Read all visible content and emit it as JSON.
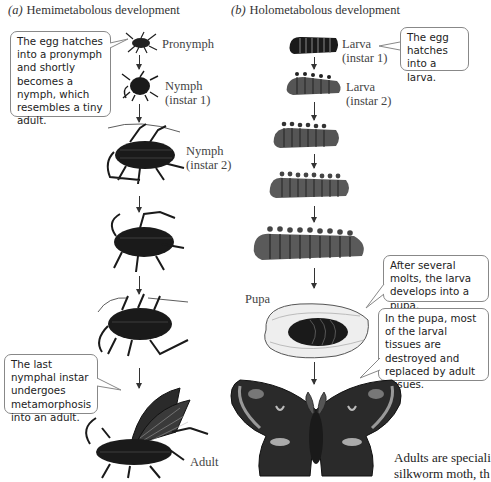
{
  "panels": {
    "a": {
      "letter": "(a)",
      "title": "Hemimetabolous development",
      "stages": [
        {
          "label": "Pronymph"
        },
        {
          "label": "Nymph\n(instar 1)"
        },
        {
          "label": "Nymph\n(instar 2)"
        },
        {
          "label": "Adult"
        }
      ],
      "callouts": [
        {
          "text": "The egg hatches into a pronymph and shortly becomes a nymph, which resembles a tiny adult."
        },
        {
          "text": "The last nymphal instar undergoes metamorphosis into an adult."
        }
      ]
    },
    "b": {
      "letter": "(b)",
      "title": "Holometabolous development",
      "stages": [
        {
          "label": "Larva\n(instar 1)"
        },
        {
          "label": "Larva\n(instar 2)"
        },
        {
          "label": "Pupa"
        }
      ],
      "callouts": [
        {
          "text": "The egg hatches into a larva."
        },
        {
          "text": "After several molts, the larva develops into a pupa."
        },
        {
          "text": "In the pupa, most of the larval tissues are destroyed and replaced by adult tissues."
        }
      ]
    }
  },
  "caption": {
    "line1": "Adults are speciali",
    "line2": "silkworm moth, th"
  },
  "colors": {
    "ink": "#1a1a1a",
    "callout_border": "#888888",
    "text": "#333333"
  }
}
